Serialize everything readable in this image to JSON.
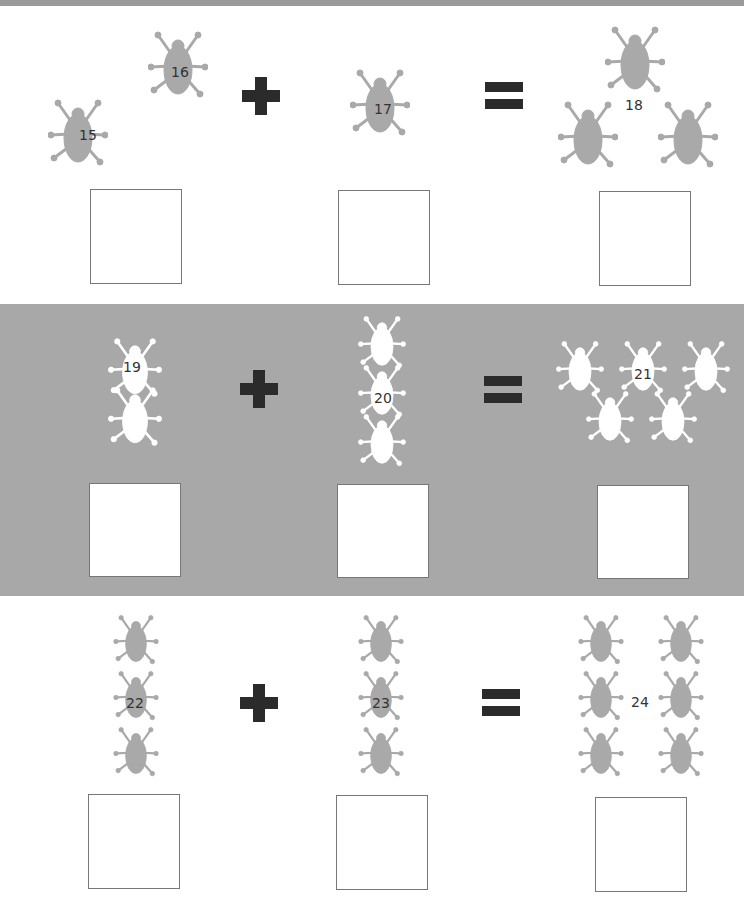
{
  "worksheet": {
    "colors": {
      "bug_gray": "#a9a9a9",
      "bug_white": "#ffffff",
      "band_background": "#a8a8a8",
      "operator": "#2b2b2b",
      "box_border": "#777777"
    },
    "rows": [
      {
        "operator_plus": "+",
        "operator_equals": "=",
        "groups": [
          {
            "label": "15",
            "count": 2,
            "second_label": "16",
            "icon": "beetle-icon"
          },
          {
            "label": "17",
            "count": 1,
            "icon": "beetle-icon"
          },
          {
            "label": "18",
            "count": 3,
            "icon": "beetle-icon"
          }
        ],
        "answer_boxes": [
          "",
          "",
          ""
        ]
      },
      {
        "operator_plus": "+",
        "operator_equals": "=",
        "groups": [
          {
            "label": "19",
            "count": 2,
            "icon": "beetle-icon"
          },
          {
            "label": "20",
            "count": 3,
            "icon": "beetle-icon"
          },
          {
            "label": "21",
            "count": 5,
            "icon": "beetle-icon"
          }
        ],
        "answer_boxes": [
          "",
          "",
          ""
        ]
      },
      {
        "operator_plus": "+",
        "operator_equals": "=",
        "groups": [
          {
            "label": "22",
            "count": 3,
            "icon": "beetle-icon"
          },
          {
            "label": "23",
            "count": 3,
            "icon": "beetle-icon"
          },
          {
            "label": "24",
            "count": 6,
            "icon": "beetle-icon"
          }
        ],
        "answer_boxes": [
          "",
          "",
          ""
        ]
      }
    ]
  }
}
